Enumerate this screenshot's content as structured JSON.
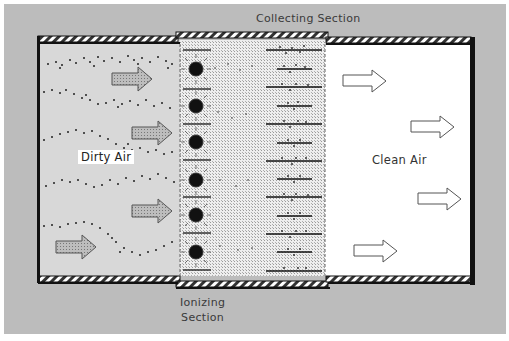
{
  "diagram": {
    "labels": {
      "collecting_section": "Collecting Section",
      "ionizing_section_line1": "Ionizing",
      "ionizing_section_line2": "Section",
      "dirty_air": "Dirty Air",
      "clean_air": "Clean Air"
    },
    "components": {
      "ionizer_wires": 6,
      "collector_plates": 13,
      "dirty_air_arrows": 5,
      "clean_air_arrows": 4
    },
    "colors": {
      "background": "#bcbcbc",
      "duct_wall": "#111111",
      "dirty_zone": "#d9d9d9",
      "clean_zone": "#ffffff",
      "particle": "#222222"
    }
  }
}
